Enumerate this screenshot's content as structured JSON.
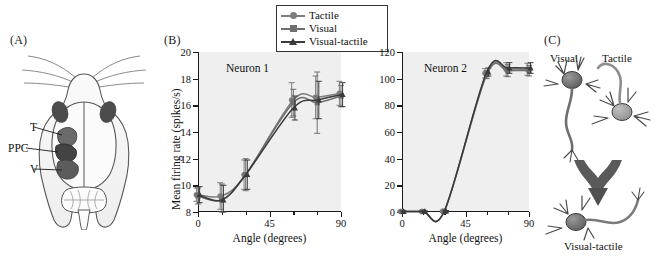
{
  "figure": {
    "panels": [
      {
        "id": "A",
        "label": "(A)"
      },
      {
        "id": "B",
        "label": "(B)"
      },
      {
        "id": "C",
        "label": "(C)"
      }
    ]
  },
  "panel_a": {
    "label": "(A)",
    "caption_regions": [
      {
        "key": "T",
        "label": "T"
      },
      {
        "key": "PPC",
        "label": "PPC"
      },
      {
        "key": "V",
        "label": "V"
      }
    ],
    "diagram_name": "rat-brain-dorsal-view",
    "colors": {
      "outline": "#4a4a4a",
      "region_dark": "#555555",
      "region_mid": "#8c8c8c",
      "fill": "#f2f2f2"
    }
  },
  "legend": {
    "entries": [
      {
        "label": "Tactile",
        "marker": "circle",
        "color": "#7d7d7d"
      },
      {
        "label": "Visual",
        "marker": "square",
        "color": "#6e6e6e"
      },
      {
        "label": "Visual-tactile",
        "marker": "triangle",
        "color": "#3a3a3a"
      }
    ],
    "border_color": "#333333"
  },
  "panel_b": {
    "label": "(B)",
    "y_axis_title": "Mean firing rate (spikes/s)",
    "x_axis_title": "Angle (degrees)"
  },
  "chart_data": [
    {
      "type": "line",
      "title": "Neuron 1",
      "xlabel": "Angle (degrees)",
      "ylabel": "Mean firing rate (spikes/s)",
      "xlim": [
        0,
        90
      ],
      "ylim": [
        8,
        20
      ],
      "xticks": [
        0,
        45,
        90
      ],
      "xticklabels": [
        "0",
        "45",
        "90"
      ],
      "xminorticks": [
        15,
        30,
        60,
        75
      ],
      "yticks": [
        8,
        10,
        12,
        14,
        16,
        18,
        20
      ],
      "yticklabels": [
        "8",
        "10",
        "12",
        "14",
        "16",
        "18",
        "20"
      ],
      "grid": false,
      "legend_position": "top-center-outside",
      "x": [
        0,
        15,
        30,
        60,
        75,
        90
      ],
      "series": [
        {
          "name": "Tactile",
          "marker": "circle",
          "color": "#7d7d7d",
          "values": [
            9.3,
            9.2,
            10.8,
            16.4,
            16.6,
            16.9
          ],
          "errors": [
            0.5,
            1.0,
            1.1,
            1.3,
            1.6,
            0.9
          ]
        },
        {
          "name": "Visual",
          "marker": "square",
          "color": "#6e6e6e",
          "values": [
            9.2,
            8.9,
            10.8,
            16.2,
            16.2,
            16.7
          ],
          "errors": [
            0.6,
            1.2,
            1.2,
            1.0,
            2.3,
            0.8
          ]
        },
        {
          "name": "Visual-tactile",
          "marker": "triangle",
          "color": "#3a3a3a",
          "values": [
            9.3,
            8.9,
            10.8,
            15.8,
            16.4,
            16.8
          ],
          "errors": [
            0.6,
            1.1,
            1.1,
            0.9,
            1.4,
            0.9
          ]
        }
      ]
    },
    {
      "type": "line",
      "title": "Neuron 2",
      "xlabel": "Angle (degrees)",
      "ylabel": "Mean firing rate (spikes/s)",
      "xlim": [
        0,
        90
      ],
      "ylim": [
        0,
        120
      ],
      "xticks": [
        0,
        45,
        90
      ],
      "xticklabels": [
        "0",
        "45",
        "90"
      ],
      "xminorticks": [
        15,
        30,
        60,
        75
      ],
      "yticks": [
        0,
        20,
        40,
        60,
        80,
        100,
        120
      ],
      "yticklabels": [
        "0",
        "20",
        "40",
        "60",
        "80",
        "100",
        "120"
      ],
      "grid": false,
      "legend_position": "top-center-outside",
      "x": [
        0,
        15,
        30,
        60,
        75,
        90
      ],
      "series": [
        {
          "name": "Tactile",
          "marker": "circle",
          "color": "#7d7d7d",
          "values": [
            0.4,
            0.4,
            0.5,
            104,
            107,
            107
          ],
          "errors": [
            0.5,
            0.5,
            0.6,
            3.5,
            5.0,
            4.5
          ]
        },
        {
          "name": "Visual",
          "marker": "square",
          "color": "#6e6e6e",
          "values": [
            0.4,
            0.4,
            0.5,
            103,
            106,
            106
          ],
          "errors": [
            0.5,
            0.5,
            0.6,
            3.0,
            4.5,
            4.0
          ]
        },
        {
          "name": "Visual-tactile",
          "marker": "triangle",
          "color": "#3a3a3a",
          "values": [
            0.4,
            0.4,
            0.5,
            105,
            108,
            108
          ],
          "errors": [
            0.5,
            0.5,
            0.6,
            3.0,
            4.0,
            4.0
          ]
        }
      ]
    }
  ],
  "panel_c": {
    "label": "(C)",
    "top_left_label": "Visual",
    "top_right_label": "Tactile",
    "bottom_label": "Visual-tactile",
    "arrow_name": "convergence-arrow",
    "colors": {
      "neuron_dark": "#6d6d6d",
      "neuron_light": "#a9a9a9",
      "arrow": "#555555"
    }
  }
}
